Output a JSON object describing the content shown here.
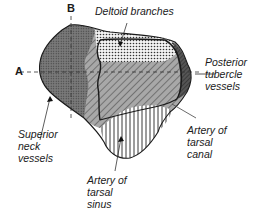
{
  "diagram": {
    "axes": {
      "a": "A",
      "b": "B"
    },
    "labels": {
      "deltoid": "Deltoid branches",
      "posterior": "Posterior\ntubercle\nvessels",
      "superior": "Superior\nneck\nvessels",
      "tarsal_sinus": "Artery of\ntarsal\nsinus",
      "tarsal_canal": "Artery of\ntarsal\ncanal"
    },
    "colors": {
      "superior_neck_fill": "#6e6e6e",
      "deltoid_fill": "#e8e8e8",
      "canal_fill": "#a0a0a0",
      "sinus_fill": "#ffffff",
      "outline": "#1a1a1a"
    }
  }
}
